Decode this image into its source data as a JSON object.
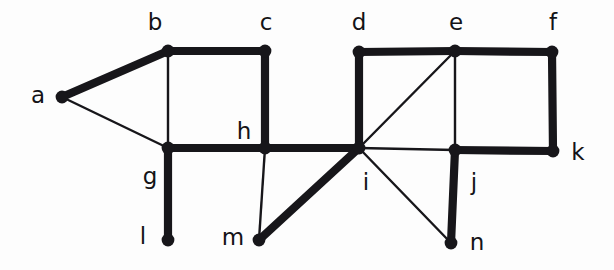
{
  "figure": {
    "kind": "undirected-graph-diagram",
    "background_color": "#fdfdfd",
    "ink_color": "#17161a",
    "width": 614,
    "height": 270,
    "thin_edge_width": 2.4,
    "thick_edge_width": 8.2,
    "vertex_radius": 6.4
  },
  "graph_data": {
    "type": "graph",
    "vertex_count": 14,
    "edge_count": 21,
    "vertices": [
      {
        "id": "a",
        "label": "a",
        "x": 62,
        "y": 97,
        "label_x": 38,
        "label_y": 96,
        "label_anchor": "middle"
      },
      {
        "id": "b",
        "label": "b",
        "x": 168,
        "y": 51,
        "label_x": 155,
        "label_y": 23,
        "label_anchor": "middle"
      },
      {
        "id": "c",
        "label": "c",
        "x": 265,
        "y": 51,
        "label_x": 266,
        "label_y": 23,
        "label_anchor": "middle"
      },
      {
        "id": "d",
        "label": "d",
        "x": 359,
        "y": 52,
        "label_x": 359,
        "label_y": 23,
        "label_anchor": "middle"
      },
      {
        "id": "e",
        "label": "e",
        "x": 455,
        "y": 51,
        "label_x": 456,
        "label_y": 23,
        "label_anchor": "middle"
      },
      {
        "id": "f",
        "label": "f",
        "x": 552,
        "y": 52,
        "label_x": 553,
        "label_y": 23,
        "label_anchor": "middle"
      },
      {
        "id": "g",
        "label": "g",
        "x": 168,
        "y": 148,
        "label_x": 150,
        "label_y": 177,
        "label_anchor": "middle"
      },
      {
        "id": "h",
        "label": "h",
        "x": 265,
        "y": 148,
        "label_x": 244,
        "label_y": 132,
        "label_anchor": "middle"
      },
      {
        "id": "i",
        "label": "i",
        "x": 359,
        "y": 148,
        "label_x": 366,
        "label_y": 183,
        "label_anchor": "middle"
      },
      {
        "id": "j",
        "label": "j",
        "x": 455,
        "y": 150,
        "label_x": 474,
        "label_y": 183,
        "label_anchor": "middle"
      },
      {
        "id": "k",
        "label": "k",
        "x": 553,
        "y": 151,
        "label_x": 578,
        "label_y": 153,
        "label_anchor": "middle"
      },
      {
        "id": "l",
        "label": "l",
        "x": 168,
        "y": 240,
        "label_x": 143,
        "label_y": 237,
        "label_anchor": "middle"
      },
      {
        "id": "m",
        "label": "m",
        "x": 259,
        "y": 240,
        "label_x": 233,
        "label_y": 238,
        "label_anchor": "middle"
      },
      {
        "id": "n",
        "label": "n",
        "x": 451,
        "y": 243,
        "label_x": 477,
        "label_y": 243,
        "label_anchor": "middle"
      }
    ],
    "edges": [
      {
        "from": "a",
        "to": "b",
        "weight": "thick"
      },
      {
        "from": "a",
        "to": "g",
        "weight": "thin"
      },
      {
        "from": "b",
        "to": "c",
        "weight": "thick"
      },
      {
        "from": "b",
        "to": "g",
        "weight": "thin"
      },
      {
        "from": "c",
        "to": "h",
        "weight": "thick"
      },
      {
        "from": "g",
        "to": "h",
        "weight": "thick"
      },
      {
        "from": "g",
        "to": "l",
        "weight": "thick"
      },
      {
        "from": "h",
        "to": "i",
        "weight": "thick"
      },
      {
        "from": "h",
        "to": "m",
        "weight": "thin"
      },
      {
        "from": "m",
        "to": "i",
        "weight": "thick"
      },
      {
        "from": "d",
        "to": "e",
        "weight": "thick"
      },
      {
        "from": "d",
        "to": "i",
        "weight": "thick"
      },
      {
        "from": "e",
        "to": "f",
        "weight": "thick"
      },
      {
        "from": "e",
        "to": "i",
        "weight": "thin"
      },
      {
        "from": "e",
        "to": "j",
        "weight": "thin"
      },
      {
        "from": "f",
        "to": "k",
        "weight": "thick"
      },
      {
        "from": "i",
        "to": "j",
        "weight": "thin"
      },
      {
        "from": "i",
        "to": "n",
        "weight": "thin"
      },
      {
        "from": "j",
        "to": "k",
        "weight": "thick"
      },
      {
        "from": "j",
        "to": "n",
        "weight": "thick"
      }
    ]
  }
}
